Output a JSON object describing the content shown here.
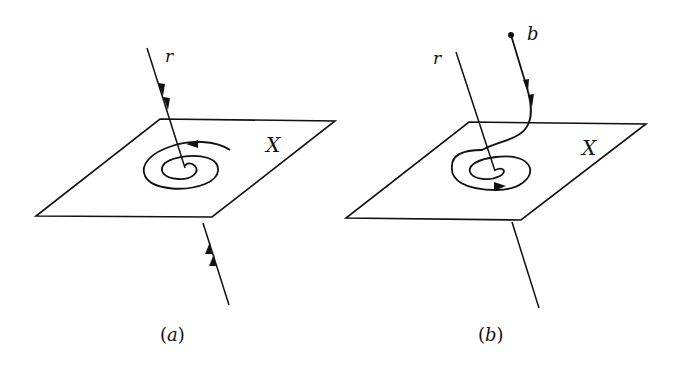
{
  "panels": [
    {
      "id": "a",
      "caption_open": "(",
      "caption_letter": "a",
      "caption_close": ")",
      "plane_label": "X",
      "line_label": "r",
      "description": "Line r pierces plane X; a spiral on X winds around the piercing point, with arrows on r pointing toward the plane from both sides"
    },
    {
      "id": "b",
      "caption_open": "(",
      "caption_letter": "b",
      "caption_close": ")",
      "plane_label": "X",
      "line_label": "r",
      "point_label": "b",
      "description": "A path starting at point b descends to plane X and spirals around the point where line r pierces the plane"
    }
  ],
  "colors": {
    "stroke": "#111111",
    "background": "#ffffff"
  }
}
